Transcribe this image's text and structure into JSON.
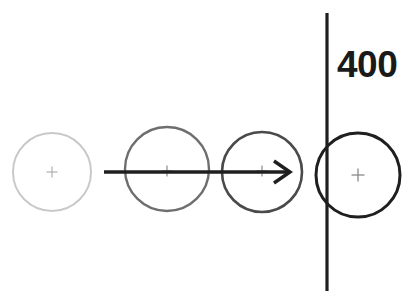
{
  "diagram": {
    "type": "schematic-diagram",
    "canvas": {
      "width": 416,
      "height": 308,
      "background_color": "#ffffff"
    },
    "annotations": [
      {
        "name": "threshold-label",
        "text": "400",
        "x": 337,
        "y": 48,
        "font_size": 37,
        "font_weight": "bold",
        "color": "#1a1a1a"
      }
    ],
    "circles": [
      {
        "name": "circle-1",
        "order": 1,
        "cx": 52,
        "cy": 172,
        "r": 39,
        "stroke_color": "#c9c9c9",
        "stroke_width": 2.0,
        "fill": "none",
        "shade": "lightest",
        "has_center_mark": true
      },
      {
        "name": "circle-2",
        "order": 2,
        "cx": 167,
        "cy": 169,
        "r": 42,
        "stroke_color": "#6e6e6e",
        "stroke_width": 2.4,
        "fill": "none",
        "shade": "medium",
        "has_center_mark": true
      },
      {
        "name": "circle-3",
        "order": 3,
        "cx": 262,
        "cy": 172,
        "r": 40,
        "stroke_color": "#4a4a4a",
        "stroke_width": 2.6,
        "fill": "none",
        "shade": "dark",
        "has_center_mark": true
      },
      {
        "name": "circle-4",
        "order": 4,
        "cx": 358,
        "cy": 175,
        "r": 42,
        "stroke_color": "#1f1f1f",
        "stroke_width": 3.0,
        "fill": "none",
        "shade": "darkest",
        "has_center_mark": true
      }
    ],
    "center_marks": [
      {
        "name": "center-mark-1",
        "cx": 52,
        "cy": 172,
        "size": 11,
        "color": "#b0b0b0",
        "stroke_width": 1.2
      },
      {
        "name": "center-mark-2",
        "cx": 167,
        "cy": 171,
        "size": 11,
        "color": "#8a8a8a",
        "stroke_width": 1.2
      },
      {
        "name": "center-mark-3",
        "cx": 262,
        "cy": 171,
        "size": 11,
        "color": "#8a8a8a",
        "stroke_width": 1.2
      },
      {
        "name": "center-mark-4",
        "cx": 358,
        "cy": 175,
        "size": 13,
        "color": "#8a8a8a",
        "stroke_width": 1.3
      }
    ],
    "arrow": {
      "name": "motion-arrow",
      "x1": 104,
      "y1": 172,
      "x2": 290,
      "y2": 172,
      "color": "#1f1f1f",
      "stroke_width": 3.4,
      "head_length": 16,
      "head_half_height": 11,
      "head_style": "open-v",
      "direction": "right"
    },
    "vertical_line": {
      "name": "threshold-line",
      "x": 327,
      "y1": 13,
      "y2": 291,
      "color": "#1f1f1f",
      "stroke_width": 3.2,
      "orientation": "vertical"
    }
  }
}
